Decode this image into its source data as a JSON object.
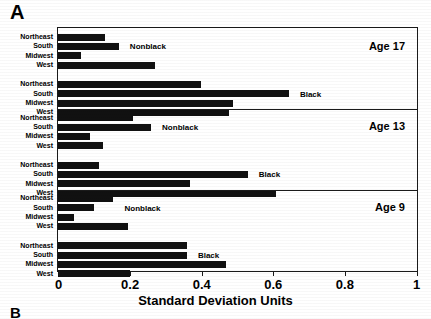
{
  "figure": {
    "panel_letter": "A",
    "panel_letter_next": "B",
    "xaxis_title": "Standard Deviation Units",
    "xticks": [
      "0",
      "0.2",
      "0.4",
      "0.6",
      "0.8",
      "1"
    ],
    "group_label_nonblack": "Nonblack",
    "group_label_black": "Black",
    "regions": [
      "Northeast",
      "South",
      "Midwest",
      "West"
    ],
    "panels": [
      "Age 17",
      "Age 13",
      "Age 9"
    ],
    "bar_color": "#111111",
    "frame_color": "#1a1a1a"
  },
  "chart_data": {
    "type": "bar",
    "orientation": "horizontal",
    "title": "",
    "xlabel": "Standard Deviation Units",
    "ylabel": "",
    "xlim": [
      0,
      1
    ],
    "xticks": [
      0,
      0.2,
      0.4,
      0.6,
      0.8,
      1
    ],
    "grid": false,
    "legend": "inline-annotation",
    "categories": [
      "Northeast",
      "South",
      "Midwest",
      "West"
    ],
    "panels": [
      {
        "name": "Age 17",
        "groups": [
          {
            "name": "Nonblack",
            "values": [
              0.13,
              0.17,
              0.065,
              0.27
            ]
          },
          {
            "name": "Black",
            "values": [
              0.4,
              0.645,
              0.49,
              0.478
            ]
          }
        ]
      },
      {
        "name": "Age 13",
        "groups": [
          {
            "name": "Nonblack",
            "values": [
              0.21,
              0.26,
              0.09,
              0.125
            ]
          },
          {
            "name": "Black",
            "values": [
              0.115,
              0.53,
              0.37,
              0.61
            ]
          }
        ]
      },
      {
        "name": "Age 9",
        "groups": [
          {
            "name": "Nonblack",
            "values": [
              0.155,
              0.1,
              0.045,
              0.195
            ]
          },
          {
            "name": "Black",
            "values": [
              0.36,
              0.36,
              0.47,
              0.2
            ]
          }
        ]
      }
    ]
  }
}
